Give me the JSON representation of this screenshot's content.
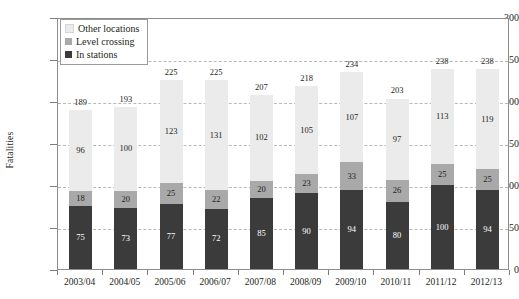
{
  "chart_data": {
    "type": "bar",
    "subtype": "stacked-bar",
    "title": "",
    "xlabel": "",
    "ylabel": "Fatalities",
    "ylim": [
      0,
      300
    ],
    "ytick_values": [
      0,
      50,
      100,
      150,
      200,
      250,
      300
    ],
    "ytick_labels": [
      "0",
      "50",
      "100",
      "150",
      "200",
      "250",
      "300"
    ],
    "grid": true,
    "grid_style": "dashed horizontal",
    "legend_position": "top-left inside plot",
    "categories": [
      "2003/04",
      "2004/05",
      "2005/06",
      "2006/07",
      "2007/08",
      "2008/09",
      "2009/10",
      "2010/11",
      "2011/12",
      "2012/13"
    ],
    "series": [
      {
        "name": "In stations",
        "color": "#3b3b3b",
        "values": [
          75,
          73,
          77,
          72,
          85,
          90,
          94,
          80,
          100,
          94
        ]
      },
      {
        "name": "Level crossing",
        "color": "#a9a9a9",
        "values": [
          18,
          20,
          25,
          22,
          20,
          23,
          33,
          26,
          25,
          25
        ]
      },
      {
        "name": "Other locations",
        "color": "#ebebeb",
        "values": [
          96,
          100,
          123,
          131,
          102,
          105,
          107,
          97,
          113,
          119
        ]
      }
    ],
    "totals": [
      189,
      193,
      225,
      225,
      207,
      218,
      234,
      203,
      238,
      238
    ],
    "stack_order_bottom_to_top": [
      "In stations",
      "Level crossing",
      "Other locations"
    ]
  },
  "legend": {
    "items": [
      {
        "label": "Other locations",
        "swatch": "#ebebeb"
      },
      {
        "label": "Level crossing",
        "swatch": "#a9a9a9"
      },
      {
        "label": "In stations",
        "swatch": "#3b3b3b"
      }
    ]
  },
  "axes": {
    "y_title": "Fatalities"
  }
}
